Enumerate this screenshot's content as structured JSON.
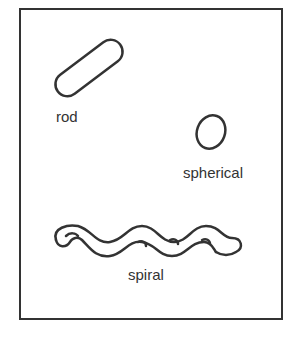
{
  "diagram": {
    "stroke_color": "#333333",
    "shapes": [
      {
        "name": "rod",
        "label": "rod"
      },
      {
        "name": "spherical",
        "label": "spherical"
      },
      {
        "name": "spiral",
        "label": "spiral"
      }
    ]
  }
}
